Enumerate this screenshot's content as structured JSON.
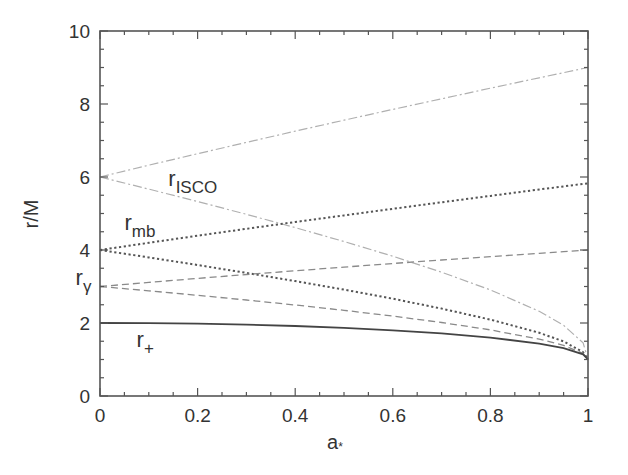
{
  "chart_data": {
    "type": "line",
    "title": "",
    "xlabel": "a*",
    "ylabel": "r/M",
    "xlim": [
      0,
      1
    ],
    "ylim": [
      0,
      10
    ],
    "grid": false,
    "legend": "inline labels",
    "x_ticks": [
      "0",
      "0.2",
      "0.4",
      "0.6",
      "0.8",
      "1"
    ],
    "y_ticks": [
      "0",
      "2",
      "4",
      "6",
      "8",
      "10"
    ],
    "x": [
      0,
      0.1,
      0.2,
      0.3,
      0.4,
      0.5,
      0.6,
      0.7,
      0.8,
      0.9,
      0.95,
      0.99,
      1.0
    ],
    "series": [
      {
        "name": "r_ISCO (retrograde)",
        "label_group": "r_ISCO",
        "style": "dashdot",
        "color": "#b0b0b0",
        "values": [
          6,
          6.323,
          6.639,
          6.949,
          7.254,
          7.555,
          7.851,
          8.143,
          8.432,
          8.717,
          8.858,
          8.972,
          9.0
        ]
      },
      {
        "name": "r_ISCO (prograde)",
        "label_group": "r_ISCO",
        "style": "dashdot",
        "color": "#b0b0b0",
        "values": [
          6,
          5.669,
          5.329,
          4.979,
          4.614,
          4.233,
          3.829,
          3.393,
          2.907,
          2.321,
          1.937,
          1.455,
          1.0
        ]
      },
      {
        "name": "r_mb (retrograde)",
        "label_group": "r_mb",
        "style": "dotted",
        "color": "#555555",
        "values": [
          4,
          4.198,
          4.391,
          4.58,
          4.766,
          4.949,
          5.13,
          5.308,
          5.483,
          5.657,
          5.743,
          5.811,
          5.828
        ]
      },
      {
        "name": "r_mb (prograde)",
        "label_group": "r_mb",
        "style": "dotted",
        "color": "#555555",
        "values": [
          4,
          3.797,
          3.589,
          3.373,
          3.149,
          2.914,
          2.665,
          2.395,
          2.094,
          1.732,
          1.497,
          1.2,
          1.0
        ]
      },
      {
        "name": "r_gamma (retrograde)",
        "label_group": "r_gamma",
        "style": "dashed",
        "color": "#8a8a8a",
        "values": [
          3,
          3.113,
          3.222,
          3.328,
          3.43,
          3.532,
          3.629,
          3.725,
          3.818,
          3.91,
          3.955,
          3.991,
          4.0
        ]
      },
      {
        "name": "r_gamma (prograde)",
        "label_group": "r_gamma",
        "style": "dashed",
        "color": "#8a8a8a",
        "values": [
          3,
          2.882,
          2.759,
          2.63,
          2.493,
          2.347,
          2.189,
          2.013,
          1.811,
          1.558,
          1.386,
          1.168,
          1.0
        ]
      },
      {
        "name": "r_+",
        "label_group": "r_plus",
        "style": "solid",
        "color": "#444444",
        "values": [
          2,
          1.995,
          1.98,
          1.954,
          1.917,
          1.866,
          1.8,
          1.714,
          1.6,
          1.436,
          1.312,
          1.141,
          1.0
        ]
      }
    ],
    "annotations": [
      {
        "text": "r_ISCO",
        "main": "r",
        "sub": "ISCO",
        "x": 0.14,
        "y": 5.75
      },
      {
        "text": "r_mb",
        "main": "r",
        "sub": "mb",
        "x": 0.05,
        "y": 4.55
      },
      {
        "text": "r_gamma",
        "main": "r",
        "sub": "γ",
        "x": -0.05,
        "y": 3.05
      },
      {
        "text": "r_+",
        "main": "r",
        "sub": "+",
        "x": 0.075,
        "y": 1.35
      }
    ]
  },
  "axes": {
    "xlabel_main": "a",
    "xlabel_sub": "*",
    "ylabel": "r/M"
  }
}
